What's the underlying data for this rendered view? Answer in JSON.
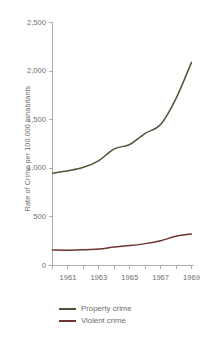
{
  "chart_data": {
    "type": "line",
    "title": "",
    "subtitle": "",
    "xlabel": "",
    "ylabel": "Rate of Crime per 100,000 Inhabitants",
    "xlim": [
      1960,
      1969
    ],
    "ylim": [
      0,
      2500
    ],
    "grid": false,
    "legend_position": "bottom-left",
    "x": [
      1960,
      1961,
      1962,
      1963,
      1964,
      1965,
      1966,
      1967,
      1968,
      1969
    ],
    "x_tick_labels": [
      "1961",
      "1963",
      "1965",
      "1967",
      "1969"
    ],
    "x_tick_values": [
      1961,
      1963,
      1965,
      1967,
      1969
    ],
    "x_minor_ticks": [
      1960,
      1961,
      1962,
      1963,
      1964,
      1965,
      1966,
      1967,
      1968,
      1969
    ],
    "y_tick_labels": [
      "0",
      "500",
      "1,000",
      "1,500",
      "2,000",
      "2,500"
    ],
    "y_tick_values": [
      0,
      500,
      1000,
      1500,
      2000,
      2500
    ],
    "series": [
      {
        "name": "Property crime",
        "color": "#4f5437",
        "values": [
          950,
          975,
          1010,
          1080,
          1200,
          1245,
          1360,
          1450,
          1720,
          2090
        ]
      },
      {
        "name": "Violent crime",
        "color": "#6d3430",
        "values": [
          160,
          158,
          162,
          170,
          190,
          205,
          225,
          255,
          300,
          325
        ]
      }
    ]
  },
  "axis": {
    "line_color": "#9a9a9a"
  },
  "legend": {
    "items": [
      {
        "label": "Property crime",
        "color": "#4f5437"
      },
      {
        "label": "Violent crime",
        "color": "#6d3430"
      }
    ]
  }
}
